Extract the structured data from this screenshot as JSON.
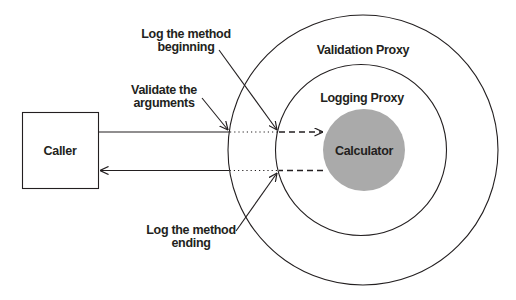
{
  "diagram": {
    "caller": {
      "label": "Caller"
    },
    "validation_proxy": {
      "label": "Validation Proxy"
    },
    "logging_proxy": {
      "label": "Logging Proxy"
    },
    "calculator": {
      "label": "Calculator",
      "fill": "#aaaaaa"
    },
    "annotations": {
      "log_begin": {
        "line1": "Log the method",
        "line2": "beginning"
      },
      "validate": {
        "line1": "Validate the",
        "line2": "arguments"
      },
      "log_end": {
        "line1": "Log the method",
        "line2": "ending"
      }
    }
  }
}
